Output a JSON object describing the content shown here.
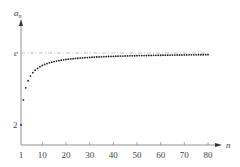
{
  "chart_data": {
    "type": "scatter",
    "title": "",
    "xlabel": "n",
    "ylabel": "a_n",
    "formula": "a_n = (1 + 1/n)^n",
    "x_ticks": [
      "1",
      "10",
      "20",
      "30",
      "40",
      "50",
      "60",
      "70",
      "80"
    ],
    "y_ticks": [
      "2",
      "e"
    ],
    "reference_line": {
      "label": "e",
      "value": 2.71828,
      "style": "dash-dot"
    },
    "xlim": [
      1,
      80
    ],
    "ylim": [
      1.8,
      2.9
    ],
    "grid": false,
    "legend": "none",
    "series": [
      {
        "name": "a_n",
        "x_range": [
          1,
          80
        ],
        "note": "values (1+1/n)^n for n = 1..80"
      }
    ]
  },
  "labels": {
    "x_axis": "n",
    "y_axis_main": "a",
    "y_axis_sub": "n",
    "e_label": "e",
    "two_label": "2"
  },
  "colors": {
    "points": "#222222",
    "axis": "#666666",
    "dashline": "#888888"
  }
}
